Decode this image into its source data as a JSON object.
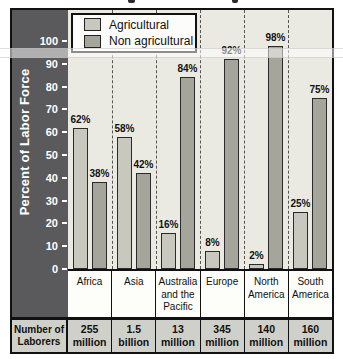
{
  "chart_data": {
    "type": "bar",
    "title": "",
    "ylabel": "Percent of Labor Force",
    "ylim": [
      0,
      100
    ],
    "yticks": [
      0,
      10,
      20,
      30,
      40,
      50,
      60,
      70,
      80,
      90,
      100
    ],
    "grid": "vertical-dashed",
    "legend_position": "top-left",
    "value_suffix": "%",
    "categories": [
      "Africa",
      "Asia",
      "Australia and the Pacific",
      "Europe",
      "North America",
      "South America"
    ],
    "series": [
      {
        "name": "Agricultural",
        "color": "#c8c8be",
        "values": [
          62,
          58,
          16,
          8,
          2,
          25
        ]
      },
      {
        "name": "Non agricultural",
        "color": "#a5a59b",
        "values": [
          38,
          42,
          84,
          92,
          98,
          75
        ]
      }
    ]
  },
  "table": {
    "row_header": "Number of Laborers",
    "cells": [
      "255 million",
      "1.5 billion",
      "13 million",
      "345 million",
      "140 million",
      "160 million"
    ]
  },
  "colors": {
    "axis_strip": "#5a5a5c",
    "plot_background": "#eaeae3",
    "table_row_background": "#d0d0ca",
    "border": "#111111"
  }
}
